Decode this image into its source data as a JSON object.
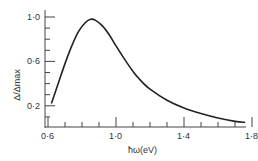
{
  "chart_data": {
    "type": "line",
    "title": "",
    "xlabel": "ħω(eV)",
    "ylabel": "Δ/Δmax",
    "xlim": [
      0.6,
      1.8
    ],
    "ylim": [
      0.0,
      1.0
    ],
    "x_ticks": [
      "0·6",
      "1·0",
      "1·4",
      "1·8"
    ],
    "y_ticks": [
      "0·2",
      "0·6",
      "1·0"
    ],
    "grid": false,
    "series": [
      {
        "name": "Δ/Δmax",
        "x": [
          0.62,
          0.66,
          0.7,
          0.74,
          0.78,
          0.82,
          0.85,
          0.88,
          0.92,
          0.96,
          1.0,
          1.05,
          1.1,
          1.15,
          1.2,
          1.3,
          1.4,
          1.5,
          1.6,
          1.7,
          1.76
        ],
        "y": [
          0.22,
          0.4,
          0.58,
          0.74,
          0.87,
          0.95,
          0.98,
          0.97,
          0.92,
          0.84,
          0.74,
          0.62,
          0.51,
          0.42,
          0.35,
          0.25,
          0.18,
          0.13,
          0.09,
          0.06,
          0.05
        ]
      }
    ]
  }
}
